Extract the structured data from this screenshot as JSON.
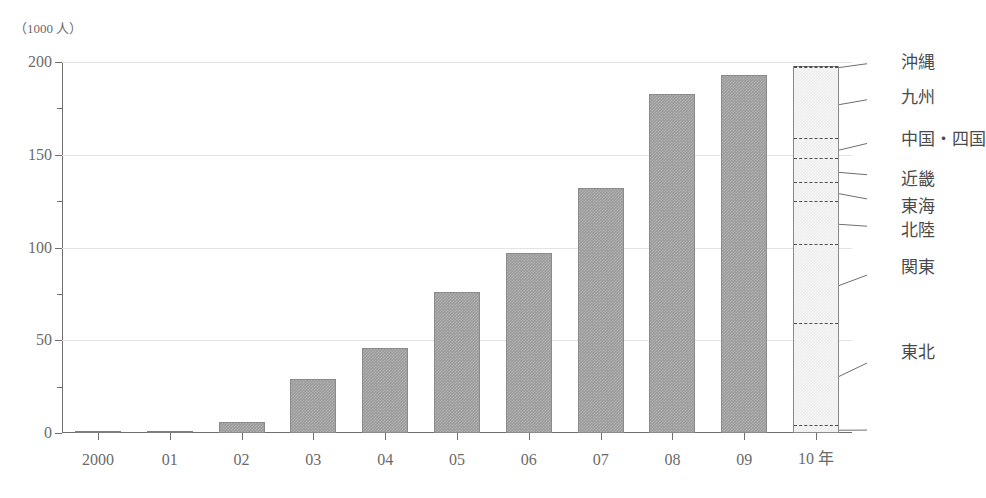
{
  "chart_data": {
    "type": "bar",
    "title": "",
    "unit_label": "（1000 人）",
    "xlabel": "",
    "ylabel": "",
    "ylim": [
      0,
      200
    ],
    "ytick_values": [
      0,
      50,
      100,
      150,
      200
    ],
    "ytick_labels": [
      "0",
      "50",
      "100",
      "150",
      "200"
    ],
    "yminor_values": [
      25,
      75,
      125,
      175
    ],
    "grid": true,
    "categories": [
      "2000",
      "01",
      "02",
      "03",
      "04",
      "05",
      "06",
      "07",
      "08",
      "09",
      "10 年"
    ],
    "values": [
      0.5,
      1,
      6,
      29,
      46,
      76,
      97,
      132,
      183,
      193,
      198
    ],
    "legend_position": "right-callout",
    "final_bar_category": "10 年",
    "stacked_segments": [
      {
        "label": "沖縄",
        "top": 198,
        "bottom": 196
      },
      {
        "label": "九州",
        "top": 196,
        "bottom": 158
      },
      {
        "label": "中国・四国",
        "top": 158,
        "bottom": 147
      },
      {
        "label": "近畿",
        "top": 147,
        "bottom": 134
      },
      {
        "label": "東海",
        "top": 134,
        "bottom": 124
      },
      {
        "label": "北陸",
        "top": 124,
        "bottom": 101
      },
      {
        "label": "関東",
        "top": 101,
        "bottom": 58
      },
      {
        "label": "東北",
        "top": 58,
        "bottom": 3
      },
      {
        "label": "",
        "top": 3,
        "bottom": 0
      }
    ]
  },
  "axis": {
    "unit": "（1000 人）"
  },
  "legend": {
    "items": [
      {
        "label": "沖縄"
      },
      {
        "label": "九州"
      },
      {
        "label": "中国・四国"
      },
      {
        "label": "近畿"
      },
      {
        "label": "東海"
      },
      {
        "label": "北陸"
      },
      {
        "label": "関東"
      },
      {
        "label": "東北"
      }
    ]
  },
  "colors": {
    "bar_fill": "#9a9a9a",
    "bar_stroke": "#8a8a8a",
    "stack_fill": "#eeeeee",
    "axis": "#6e6e6e",
    "grid": "#e3e3e3",
    "text": "#6a6a6a"
  }
}
